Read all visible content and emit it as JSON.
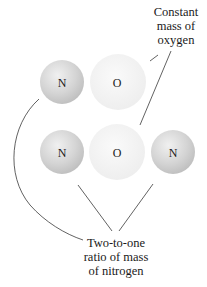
{
  "molecules": [
    {
      "name": "NO",
      "atoms": [
        {
          "symbol": "N",
          "element": "nitrogen"
        },
        {
          "symbol": "O",
          "element": "oxygen"
        }
      ]
    },
    {
      "name": "N2O",
      "atoms": [
        {
          "symbol": "N",
          "element": "nitrogen"
        },
        {
          "symbol": "O",
          "element": "oxygen"
        },
        {
          "symbol": "N",
          "element": "nitrogen"
        }
      ]
    }
  ],
  "captions": {
    "oxygen": [
      "Constant",
      "mass of",
      "oxygen"
    ],
    "nitrogen": [
      "Two-to-one",
      "ratio of mass",
      "of nitrogen"
    ]
  },
  "colors": {
    "nitrogen_fill": "#d2d2d2",
    "oxygen_fill": "#f1f1f1",
    "leader_line": "#3a3a3a",
    "text": "#1a1a1a"
  }
}
